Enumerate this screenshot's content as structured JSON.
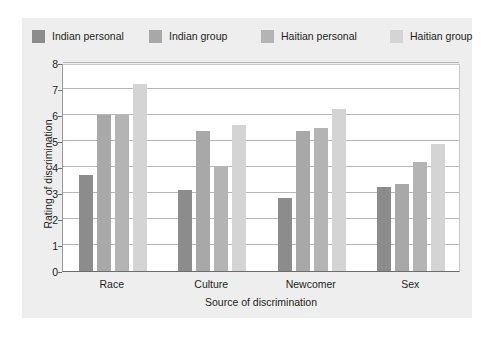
{
  "chart_data": {
    "type": "bar",
    "title": "",
    "xlabel": "Source of discrimination",
    "ylabel": "Rating of discrimination",
    "categories": [
      "Race",
      "Culture",
      "Newcomer",
      "Sex"
    ],
    "ylim": [
      0,
      8
    ],
    "yticks": [
      0,
      1,
      2,
      3,
      4,
      5,
      6,
      7,
      8
    ],
    "grid": true,
    "legend_position": "top",
    "series": [
      {
        "name": "Indian personal",
        "color": "#8c8c8c",
        "values": [
          3.7,
          3.1,
          2.8,
          3.25
        ]
      },
      {
        "name": "Indian group",
        "color": "#a8a8a8",
        "values": [
          6.0,
          5.4,
          5.4,
          3.35
        ]
      },
      {
        "name": "Haitian personal",
        "color": "#b4b4b4",
        "values": [
          6.0,
          4.0,
          5.5,
          4.2
        ]
      },
      {
        "name": "Haitian group",
        "color": "#d4d4d4",
        "values": [
          7.2,
          5.6,
          6.25,
          4.9
        ]
      }
    ]
  }
}
